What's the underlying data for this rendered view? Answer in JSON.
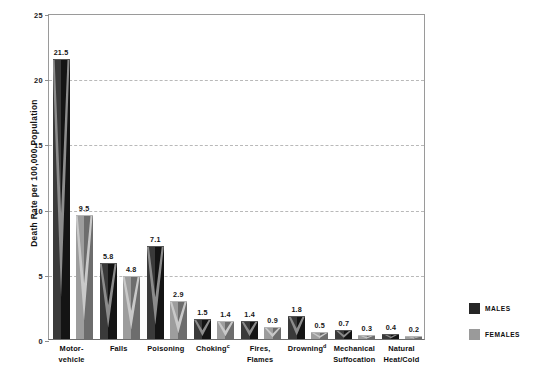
{
  "chart_data": {
    "type": "bar",
    "title": "",
    "xlabel": "",
    "ylabel": "Death Rate per 100,000 Population",
    "ylim": [
      0,
      25
    ],
    "yticks": [
      0,
      5,
      10,
      15,
      20,
      25
    ],
    "grid": true,
    "legend_position": "right",
    "categories": [
      "Motor-vehicle",
      "Falls",
      "Poisoning",
      "Choking",
      "Fires, Flames",
      "Drowning",
      "Mechanical Suffocation",
      "Natural Heat/Cold"
    ],
    "category_lines": [
      [
        "Motor-",
        "vehicle"
      ],
      [
        "Falls"
      ],
      [
        "Poisoning"
      ],
      [
        "Choking"
      ],
      [
        "Fires,",
        "Flames"
      ],
      [
        "Drowning"
      ],
      [
        "Mechanical",
        "Suffocation"
      ],
      [
        "Natural",
        "Heat/Cold"
      ]
    ],
    "category_footnotes": [
      "",
      "",
      "",
      "c",
      "",
      "d",
      "",
      ""
    ],
    "series": [
      {
        "name": "MALES",
        "color": "#262626",
        "values": [
          21.5,
          5.8,
          7.1,
          1.5,
          1.4,
          1.8,
          0.7,
          0.4
        ]
      },
      {
        "name": "FEMALES",
        "color": "#9a9a9a",
        "values": [
          9.5,
          4.8,
          2.9,
          1.4,
          0.9,
          0.5,
          0.3,
          0.2
        ]
      }
    ],
    "value_labels": {
      "males": [
        "21.5",
        "5.8",
        "7.1",
        "1.5",
        "1.4",
        "1.8",
        "0.7",
        "0.4"
      ],
      "females": [
        "9.5",
        "4.8",
        "2.9",
        "1.4",
        "0.9",
        "0.5",
        "0.3",
        "0.2"
      ]
    }
  },
  "legend": {
    "items": [
      {
        "label": "MALES",
        "color": "#262626"
      },
      {
        "label": "FEMALES",
        "color": "#9a9a9a"
      }
    ]
  },
  "axis": {
    "y_title": "Death Rate per 100,000 Population",
    "y_tick_labels": [
      "0",
      "5",
      "10",
      "15",
      "20",
      "25"
    ]
  }
}
